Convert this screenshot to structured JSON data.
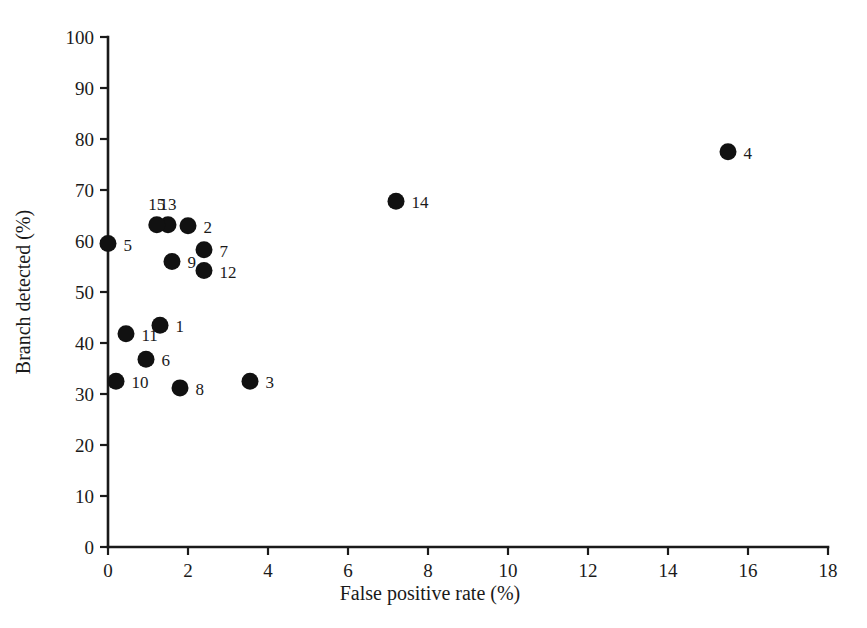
{
  "chart_data": {
    "type": "scatter",
    "title": "",
    "xlabel": "False positive rate (%)",
    "ylabel": "Branch detected (%)",
    "xlim": [
      0,
      18
    ],
    "ylim": [
      0,
      100
    ],
    "xticks": [
      0,
      2,
      4,
      6,
      8,
      10,
      12,
      14,
      16,
      18
    ],
    "yticks": [
      0,
      10,
      20,
      30,
      40,
      50,
      60,
      70,
      80,
      90,
      100
    ],
    "xtick_labels": [
      "0",
      "2",
      "4",
      "6",
      "8",
      "10",
      "12",
      "14",
      "16",
      "18"
    ],
    "ytick_labels": [
      "0",
      "10",
      "20",
      "30",
      "40",
      "50",
      "60",
      "70",
      "80",
      "90",
      "100"
    ],
    "grid": false,
    "legend": false,
    "marker": "filled-circle",
    "marker_color": "#111111",
    "points": [
      {
        "label": "1",
        "x": 1.3,
        "y": 43.5,
        "label_pos": "right"
      },
      {
        "label": "2",
        "x": 2.0,
        "y": 63.0,
        "label_pos": "right"
      },
      {
        "label": "3",
        "x": 3.55,
        "y": 32.5,
        "label_pos": "right"
      },
      {
        "label": "4",
        "x": 15.5,
        "y": 77.5,
        "label_pos": "right"
      },
      {
        "label": "5",
        "x": 0.0,
        "y": 59.5,
        "label_pos": "right"
      },
      {
        "label": "6",
        "x": 0.95,
        "y": 36.8,
        "label_pos": "right"
      },
      {
        "label": "7",
        "x": 2.4,
        "y": 58.3,
        "label_pos": "right"
      },
      {
        "label": "8",
        "x": 1.8,
        "y": 31.2,
        "label_pos": "right"
      },
      {
        "label": "9",
        "x": 1.6,
        "y": 56.0,
        "label_pos": "right"
      },
      {
        "label": "10",
        "x": 0.2,
        "y": 32.5,
        "label_pos": "right"
      },
      {
        "label": "11",
        "x": 0.45,
        "y": 41.8,
        "label_pos": "right"
      },
      {
        "label": "12",
        "x": 2.4,
        "y": 54.2,
        "label_pos": "right"
      },
      {
        "label": "13",
        "x": 1.5,
        "y": 63.2,
        "label_pos": "above"
      },
      {
        "label": "14",
        "x": 7.2,
        "y": 67.8,
        "label_pos": "right"
      },
      {
        "label": "15",
        "x": 1.22,
        "y": 63.2,
        "label_pos": "above"
      }
    ]
  }
}
